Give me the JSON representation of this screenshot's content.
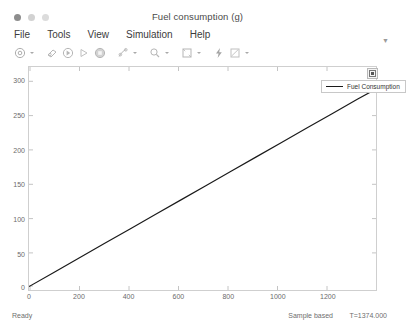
{
  "window": {
    "title": "Fuel consumption (g)",
    "traffic_lights": [
      "close",
      "minimize",
      "zoom"
    ]
  },
  "menubar": {
    "items": [
      {
        "label": "File",
        "name": "menu-file"
      },
      {
        "label": "Tools",
        "name": "menu-tools"
      },
      {
        "label": "View",
        "name": "menu-view"
      },
      {
        "label": "Simulation",
        "name": "menu-simulation"
      },
      {
        "label": "Help",
        "name": "menu-help"
      }
    ],
    "overflow_glyph": "▼"
  },
  "toolbar": {
    "buttons": [
      {
        "name": "print-icon",
        "tooltip": "Print"
      },
      {
        "name": "configuration-properties-icon",
        "tooltip": "Configuration Properties"
      },
      {
        "name": "run-back-to-start-icon",
        "tooltip": "Rewind"
      },
      {
        "name": "step-forward-icon",
        "tooltip": "Step Forward"
      },
      {
        "name": "run-icon",
        "tooltip": "Run"
      },
      {
        "name": "stop-icon",
        "tooltip": "Stop"
      },
      {
        "name": "data-cursors-icon",
        "tooltip": "Cursor Measurements"
      },
      {
        "name": "zoom-icon",
        "tooltip": "Zoom"
      },
      {
        "name": "autoscale-icon",
        "tooltip": "Autoscale"
      },
      {
        "name": "highlight-signal-icon",
        "tooltip": "Highlight Signal"
      },
      {
        "name": "signal-selection-icon",
        "tooltip": "Signal Selection"
      }
    ]
  },
  "plot": {
    "legend": {
      "visible": true,
      "entries": [
        {
          "label": "Fuel Consumption",
          "color": "#1a1a1a"
        }
      ]
    },
    "axes_button_name": "axes-toolbar-button"
  },
  "statusbar": {
    "ready_label": "Ready",
    "mode_label": "Sample based",
    "time_label": "T=1374.000"
  },
  "chart_data": {
    "type": "line",
    "title": "",
    "xlabel": "",
    "ylabel": "",
    "xlim": [
      0,
      1374
    ],
    "ylim": [
      -5,
      320
    ],
    "xticks": [
      0,
      200,
      400,
      600,
      800,
      1000,
      1200
    ],
    "xticklabels": [
      "0",
      "200",
      "400",
      "600",
      "800",
      "1000",
      "1200"
    ],
    "yticks": [
      0,
      50,
      100,
      150,
      200,
      250,
      300
    ],
    "yticklabels": [
      "0",
      "50",
      "100",
      "150",
      "200",
      "250",
      "300"
    ],
    "grid": false,
    "legend_position": "upper right",
    "series": [
      {
        "name": "Fuel Consumption",
        "color": "#1a1a1a",
        "width": 1.2,
        "x": [
          0,
          100,
          200,
          300,
          400,
          500,
          600,
          700,
          800,
          900,
          1000,
          1100,
          1200,
          1300,
          1374
        ],
        "y": [
          0,
          21,
          42,
          63,
          84,
          105,
          126,
          147,
          168,
          189,
          210,
          231,
          252,
          273,
          288
        ]
      }
    ]
  }
}
